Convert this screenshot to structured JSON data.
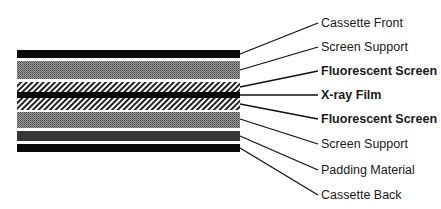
{
  "layers": [
    {
      "id": "cassette-front",
      "label": "Cassette Front",
      "bold": false,
      "pattern": "black",
      "y": 50,
      "h": 8,
      "lineFromY": 54,
      "labelY": 16
    },
    {
      "id": "screen-support-front",
      "label": "Screen Support",
      "bold": false,
      "pattern": "grey-halftone",
      "y": 61,
      "h": 18,
      "lineFromY": 70,
      "labelY": 40
    },
    {
      "id": "fluorescent-screen-front",
      "label": "Fluorescent Screen",
      "bold": true,
      "pattern": "hatch",
      "y": 82,
      "h": 10,
      "lineFromY": 87,
      "labelY": 64
    },
    {
      "id": "xray-film",
      "label": "X-ray Film",
      "bold": true,
      "pattern": "black",
      "y": 92,
      "h": 6,
      "lineFromY": 95,
      "labelY": 88
    },
    {
      "id": "fluorescent-screen-back",
      "label": "Fluorescent Screen",
      "bold": true,
      "pattern": "hatch",
      "y": 98,
      "h": 12,
      "lineFromY": 104,
      "labelY": 112
    },
    {
      "id": "screen-support-back",
      "label": "Screen Support",
      "bold": false,
      "pattern": "grey-halftone",
      "y": 112,
      "h": 16,
      "lineFromY": 119,
      "labelY": 137
    },
    {
      "id": "padding-material",
      "label": "Padding Material",
      "bold": false,
      "pattern": "dark-grey",
      "y": 131,
      "h": 10,
      "lineFromY": 136,
      "labelY": 163
    },
    {
      "id": "cassette-back",
      "label": "Cassette Back",
      "bold": false,
      "pattern": "black",
      "y": 144,
      "h": 8,
      "lineFromY": 148,
      "labelY": 188
    }
  ],
  "colors": {
    "black": "#0a0a0a",
    "grey": "#7a7a7a",
    "darkGrey": "#3a3a3a",
    "line": "#111111"
  }
}
